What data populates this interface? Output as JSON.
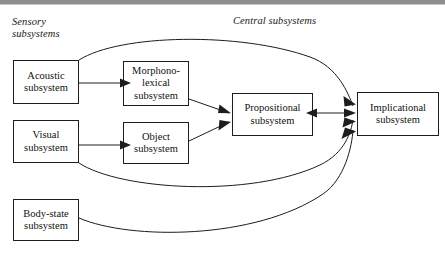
{
  "figure": {
    "labels": {
      "sensory": "Sensory\nsubsystems",
      "central": "Central subsystems"
    },
    "nodes": [
      {
        "id": "acoustic",
        "label": "Acoustic\nsubsystem"
      },
      {
        "id": "visual",
        "label": "Visual\nsubsystem"
      },
      {
        "id": "bodystate",
        "label": "Body-state\nsubsystem"
      },
      {
        "id": "morpho",
        "label": "Morphono-\nlexical\nsubsystem"
      },
      {
        "id": "object",
        "label": "Object\nsubsystem"
      },
      {
        "id": "prop",
        "label": "Propositional\nsubsystem"
      },
      {
        "id": "implic",
        "label": "Implicational\nsubsystem"
      }
    ],
    "edges": [
      {
        "id": "acoustic-to-morpho",
        "from": "acoustic",
        "to": "morpho",
        "style": "straight",
        "direction": "forward"
      },
      {
        "id": "visual-to-object",
        "from": "visual",
        "to": "object",
        "style": "straight",
        "direction": "forward"
      },
      {
        "id": "morpho-to-prop",
        "from": "morpho",
        "to": "prop",
        "style": "straight",
        "direction": "forward"
      },
      {
        "id": "object-to-prop",
        "from": "object",
        "to": "prop",
        "style": "straight",
        "direction": "forward"
      },
      {
        "id": "prop-to-implic",
        "from": "prop",
        "to": "implic",
        "style": "straight",
        "direction": "both"
      },
      {
        "id": "acoustic-to-implic",
        "from": "acoustic",
        "to": "implic",
        "style": "curve",
        "direction": "forward"
      },
      {
        "id": "visual-to-implic",
        "from": "visual",
        "to": "implic",
        "style": "curve",
        "direction": "forward"
      },
      {
        "id": "bodystate-to-implic",
        "from": "bodystate",
        "to": "implic",
        "style": "curve",
        "direction": "forward"
      }
    ],
    "colors": {
      "line": "#1d1d1d",
      "box_border": "#1d1d1d",
      "text": "#111111",
      "background": "#ffffff",
      "top_rule": "#8e8e8e"
    }
  }
}
